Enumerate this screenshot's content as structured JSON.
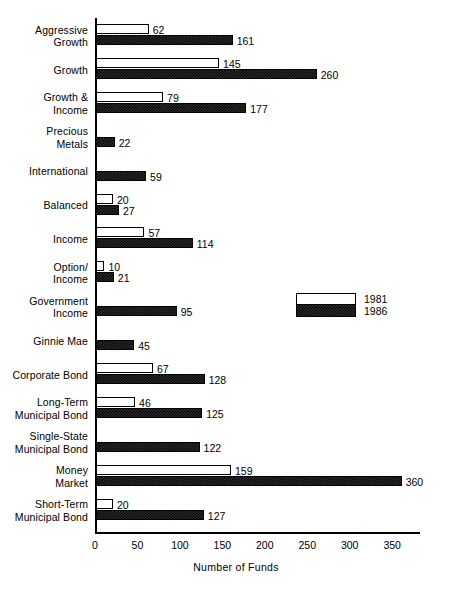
{
  "chart_data": {
    "type": "bar",
    "orientation": "horizontal",
    "title": "",
    "xlabel": "Number of Funds",
    "ylabel": "",
    "xlim": [
      0,
      380
    ],
    "xticks": [
      0,
      50,
      100,
      150,
      200,
      250,
      300,
      350
    ],
    "grid": false,
    "legend_position": "middle-right",
    "categories": [
      "Aggressive\nGrowth",
      "Growth",
      "Growth &\nIncome",
      "Precious\nMetals",
      "International",
      "Balanced",
      "Income",
      "Option/\nIncome",
      "Government\nIncome",
      "Ginnie Mae",
      "Corporate Bond",
      "Long-Term\nMunicipal Bond",
      "Single-State\nMunicipal Bond",
      "Money\nMarket",
      "Short-Term\nMunicipal Bond"
    ],
    "series": [
      {
        "name": "1981",
        "style": "white",
        "values": [
          62,
          145,
          79,
          0,
          0,
          20,
          57,
          10,
          0,
          0,
          67,
          46,
          0,
          159,
          20
        ],
        "labels": [
          "62",
          "145",
          "79",
          "",
          "",
          "20",
          "57",
          "10",
          "",
          "",
          "67",
          "46",
          "",
          "159",
          "20"
        ]
      },
      {
        "name": "1986",
        "style": "hatched",
        "values": [
          161,
          260,
          177,
          22,
          59,
          27,
          114,
          21,
          95,
          45,
          128,
          125,
          122,
          360,
          127
        ],
        "labels": [
          "161",
          "260",
          "177",
          "22",
          "59",
          "27",
          "114",
          "21",
          "95",
          "45",
          "128",
          "125",
          "122",
          "360",
          "127"
        ]
      }
    ]
  },
  "legend": {
    "items": [
      {
        "label": "1981",
        "swatch": "white"
      },
      {
        "label": "1986",
        "swatch": "hatched"
      }
    ]
  },
  "axis": {
    "x_title": "Number of Funds",
    "tick_labels": [
      "0",
      "50",
      "100",
      "150",
      "200",
      "250",
      "300",
      "350"
    ]
  },
  "colors": {
    "ink": "#000000",
    "paper": "#ffffff",
    "series_1981": "#ffffff",
    "series_1986": "#2a2a2a"
  }
}
